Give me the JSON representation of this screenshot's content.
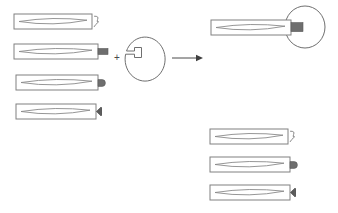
{
  "figure": {
    "background_color": "#ffffff",
    "stroke_color": "#808080",
    "tab_color": "#6e6e6e",
    "arrow_color": "#3f3f3f",
    "width": 338,
    "height": 213
  },
  "operator": {
    "plus_symbol": "+"
  },
  "left_group": {
    "label": "reactant-bars",
    "items": [
      {
        "id": "bar-1",
        "x": 14,
        "y": 14,
        "w": 78,
        "h": 15,
        "end_feature": "squiggle",
        "name": "bar-with-squiggle"
      },
      {
        "id": "bar-2",
        "x": 14,
        "y": 44,
        "w": 84,
        "h": 15,
        "end_feature": "block-tab",
        "name": "bar-with-block-tab"
      },
      {
        "id": "bar-3",
        "x": 16,
        "y": 75,
        "w": 82,
        "h": 15,
        "end_feature": "round-tab",
        "name": "bar-with-round-tab"
      },
      {
        "id": "bar-4",
        "x": 16,
        "y": 104,
        "w": 80,
        "h": 15,
        "end_feature": "triangle-tab",
        "name": "bar-with-triangle-tab"
      }
    ]
  },
  "reagent": {
    "name": "notched-circle",
    "cx": 145,
    "cy": 58,
    "rx": 20,
    "ry": 22,
    "notch_label": "slot"
  },
  "arrow": {
    "name": "reaction-arrow",
    "x1": 172,
    "x2": 200,
    "y": 58,
    "direction": "right"
  },
  "product_group": {
    "label": "product-assembly",
    "bar": {
      "id": "product-bar",
      "x": 211,
      "y": 20,
      "w": 80,
      "h": 15,
      "end_feature": "inserted-tab",
      "name": "product-bar-inserted"
    },
    "circle": {
      "cx": 305,
      "cy": 27,
      "rx": 20,
      "ry": 21,
      "name": "product-circle"
    }
  },
  "byproduct_group": {
    "label": "byproduct-bars",
    "items": [
      {
        "id": "byproduct-1",
        "x": 210,
        "y": 129,
        "w": 78,
        "h": 15,
        "end_feature": "squiggle",
        "name": "byproduct-with-squiggle"
      },
      {
        "id": "byproduct-2",
        "x": 210,
        "y": 157,
        "w": 80,
        "h": 15,
        "end_feature": "round-tab",
        "name": "byproduct-with-round-tab"
      },
      {
        "id": "byproduct-3",
        "x": 210,
        "y": 185,
        "w": 80,
        "h": 15,
        "end_feature": "triangle-tab",
        "name": "byproduct-with-triangle-tab"
      }
    ]
  }
}
